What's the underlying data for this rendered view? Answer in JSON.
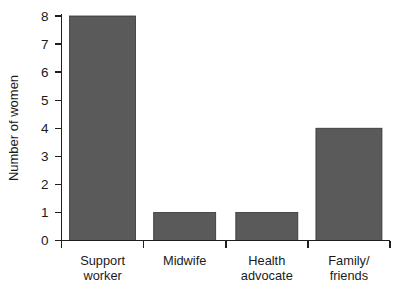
{
  "chart_data": {
    "type": "bar",
    "title": "",
    "xlabel": "",
    "ylabel": "Number of women",
    "categories": [
      "Support worker",
      "Midwife",
      "Health advocate",
      "Family/ friends"
    ],
    "category_lines": [
      [
        "Support",
        "worker"
      ],
      [
        "Midwife",
        ""
      ],
      [
        "Health",
        "advocate"
      ],
      [
        "Family/",
        "friends"
      ]
    ],
    "values": [
      8,
      1,
      1,
      4
    ],
    "ylim": [
      0,
      8
    ],
    "ytick_labels": [
      "0",
      "1",
      "2",
      "3",
      "4",
      "5",
      "6",
      "7",
      "8"
    ],
    "ytick_values": [
      0,
      1,
      2,
      3,
      4,
      5,
      6,
      7,
      8
    ],
    "grid": false,
    "legend": false,
    "legend_position": "none",
    "bar_color": "#5a5a5a",
    "bar_edge_color": "#333333",
    "axis_color": "#1f1f1f",
    "background_color": "#ffffff"
  }
}
